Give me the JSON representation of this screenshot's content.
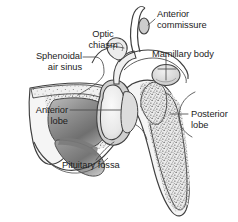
{
  "figure": {
    "kind": "anatomical-illustration",
    "background_color": "#ffffff",
    "line_color": "#3d3d3d",
    "text_color": "#1d1d1d"
  },
  "labels": {
    "anterior_commissure": {
      "line1": "Anterior",
      "line2": "commissure"
    },
    "optic_chiasm": {
      "line1": "Optic",
      "line2": "chiasm"
    },
    "mamillary_body": {
      "line1": "Mamillary body"
    },
    "sphenoidal_air_sinus": {
      "line1": "Sphenoidal",
      "line2": "air sinus"
    },
    "anterior_lobe": {
      "line1": "Anterior",
      "line2": "lobe"
    },
    "posterior_lobe": {
      "line1": "Posterior",
      "line2": "lobe"
    },
    "pituitary_fossa": {
      "line1": "Pituitary fossa"
    }
  },
  "structures": [
    {
      "name": "lamina-terminalis",
      "fill": "#f2f2f2"
    },
    {
      "name": "anterior-commissure-oval",
      "fill": "#cfcfcf"
    },
    {
      "name": "optic-chiasm",
      "fill": "#ececec"
    },
    {
      "name": "hypothalamus-floor",
      "fill": "#f4f4f4"
    },
    {
      "name": "mamillary-body",
      "fill": "#dcdcdc"
    },
    {
      "name": "pituitary-stalk",
      "fill": "#f0f0f0"
    },
    {
      "name": "anterior-lobe",
      "fill": "#e6e6e6"
    },
    {
      "name": "posterior-lobe",
      "fill": "#dedede"
    },
    {
      "name": "sphenoid-bone",
      "fill": "#e9e9e9"
    },
    {
      "name": "sphenoidal-air-sinus",
      "fill": "#8e8e8e"
    },
    {
      "name": "clivus-bone",
      "fill": "#e4e4e4"
    },
    {
      "name": "dura-diaphragma-sellae",
      "fill": "#cdcdcd"
    }
  ]
}
